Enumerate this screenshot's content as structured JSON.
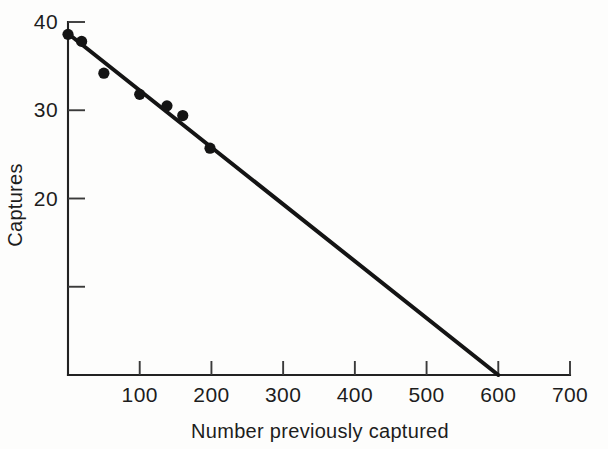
{
  "chart_data": {
    "type": "scatter",
    "title": "",
    "subtitle": "",
    "xlabel": "Number previously captured",
    "ylabel": "Captures",
    "xlim": [
      0,
      700
    ],
    "ylim": [
      0,
      40
    ],
    "grid": false,
    "legend": null,
    "x_ticks": [
      0,
      100,
      200,
      300,
      400,
      500,
      600,
      700
    ],
    "x_tick_labels": [
      "",
      "100",
      "200",
      "300",
      "400",
      "500",
      "600",
      "700"
    ],
    "y_ticks": [
      0,
      10,
      20,
      30,
      40
    ],
    "y_tick_labels": [
      "",
      "",
      "20",
      "30",
      "40"
    ],
    "points": [
      {
        "x": 0,
        "y": 38.6
      },
      {
        "x": 19,
        "y": 37.8
      },
      {
        "x": 50,
        "y": 34.2
      },
      {
        "x": 100,
        "y": 31.8
      },
      {
        "x": 138,
        "y": 30.5
      },
      {
        "x": 160,
        "y": 29.4
      },
      {
        "x": 198,
        "y": 25.7
      }
    ],
    "fit_line": {
      "x_start": 0,
      "y_start": 38.7,
      "x_end": 600,
      "y_end": 0.0,
      "slope": -0.0645,
      "intercept": 38.7
    },
    "series": [
      {
        "name": "Captures vs number previously captured",
        "x": [
          0,
          19,
          50,
          100,
          138,
          160,
          198
        ],
        "values": [
          38.6,
          37.8,
          34.2,
          31.8,
          30.5,
          29.4,
          25.7
        ]
      }
    ],
    "colors": {
      "point": "#141414",
      "line": "#141414",
      "axis": "#222222",
      "background": "#fdfdfc"
    }
  },
  "labels": {
    "x_title": "Number previously captured",
    "y_title": "Captures"
  }
}
